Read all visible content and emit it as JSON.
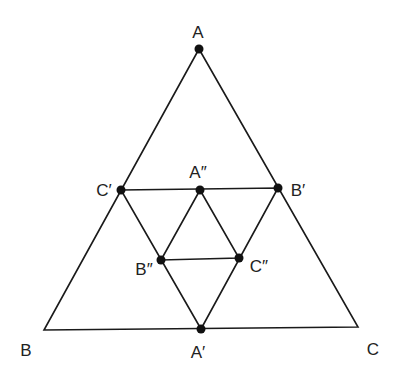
{
  "diagram": {
    "type": "nested-medial-triangles",
    "colors": {
      "line": "#1a1a1a",
      "point": "#111111",
      "label": "#222222",
      "background": "#ffffff"
    },
    "outer_triangle": {
      "vertices": {
        "A": [
          199,
          49
        ],
        "B": [
          44,
          330
        ],
        "C": [
          358,
          327
        ]
      },
      "labels": {
        "A": {
          "text": "A",
          "pos": [
            198,
            38
          ]
        },
        "B": {
          "text": "B",
          "pos": [
            26,
            356
          ]
        },
        "C": {
          "text": "C",
          "pos": [
            373,
            355
          ]
        }
      }
    },
    "medial_triangle": {
      "vertices": {
        "A1": [
          201,
          329
        ],
        "B1": [
          278,
          188
        ],
        "C1": [
          121,
          190
        ]
      },
      "labels": {
        "A1": {
          "text": "A′",
          "pos": [
            198,
            358
          ]
        },
        "B1": {
          "text": "B′",
          "pos": [
            298,
            196
          ]
        },
        "C1": {
          "text": "C′",
          "pos": [
            104,
            196
          ]
        }
      }
    },
    "inner_medial_triangle": {
      "vertices": {
        "A2": [
          200,
          190
        ],
        "B2": [
          161,
          260
        ],
        "C2": [
          239,
          258
        ]
      },
      "labels": {
        "A2": {
          "text": "A″",
          "pos": [
            198,
            178
          ]
        },
        "B2": {
          "text": "B″",
          "pos": [
            144,
            275
          ]
        },
        "C2": {
          "text": "C″",
          "pos": [
            259,
            272
          ]
        }
      }
    },
    "points": [
      "A",
      "C′",
      "A″",
      "B′",
      "B″",
      "C″",
      "A′"
    ]
  }
}
